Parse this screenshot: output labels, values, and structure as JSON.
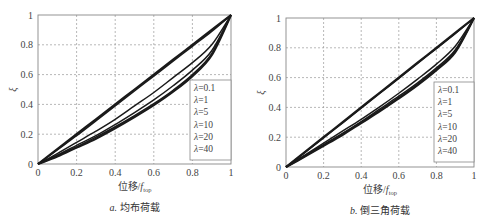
{
  "chart_data": [
    {
      "type": "line",
      "panel": "a",
      "caption": "a. 均布荷载",
      "caption_prefix": "a.",
      "caption_text": "均布荷载",
      "xlabel": "位移/f_top",
      "xlabel_main": "位移/",
      "xlabel_var": "f",
      "xlabel_sub": "top",
      "ylabel": "ξ",
      "xlim": [
        0,
        1
      ],
      "ylim": [
        0,
        1
      ],
      "xticks": [
        "0",
        "0.2",
        "0.4",
        "0.6",
        "0.8",
        "1"
      ],
      "yticks": [
        "0",
        "0.2",
        "0.4",
        "0.6",
        "0.8",
        "1"
      ],
      "grid": true,
      "legend_position": "right-inner",
      "legend": [
        "λ=0.1",
        "λ=1",
        "λ=5",
        "λ=10",
        "λ=20",
        "λ=40"
      ],
      "x": [
        0,
        0.1,
        0.2,
        0.3,
        0.4,
        0.5,
        0.6,
        0.7,
        0.8,
        0.9,
        1.0
      ],
      "series": [
        {
          "name": "λ=0.1",
          "values": [
            0,
            0.1,
            0.2,
            0.3,
            0.4,
            0.5,
            0.6,
            0.7,
            0.8,
            0.9,
            1.0
          ]
        },
        {
          "name": "λ=1",
          "values": [
            0,
            0.095,
            0.19,
            0.29,
            0.39,
            0.49,
            0.59,
            0.69,
            0.79,
            0.89,
            1.0
          ]
        },
        {
          "name": "λ=5",
          "values": [
            0,
            0.07,
            0.145,
            0.22,
            0.3,
            0.39,
            0.48,
            0.58,
            0.68,
            0.8,
            1.0
          ]
        },
        {
          "name": "λ=10",
          "values": [
            0,
            0.06,
            0.125,
            0.19,
            0.265,
            0.345,
            0.43,
            0.525,
            0.63,
            0.76,
            1.0
          ]
        },
        {
          "name": "λ=20",
          "values": [
            0,
            0.055,
            0.115,
            0.18,
            0.25,
            0.325,
            0.405,
            0.495,
            0.6,
            0.74,
            1.0
          ]
        },
        {
          "name": "λ=40",
          "values": [
            0,
            0.05,
            0.11,
            0.17,
            0.24,
            0.315,
            0.395,
            0.485,
            0.59,
            0.73,
            1.0
          ]
        }
      ]
    },
    {
      "type": "line",
      "panel": "b",
      "caption": "b. 倒三角荷载",
      "caption_prefix": "b.",
      "caption_text": "倒三角荷载",
      "xlabel": "位移/f_top",
      "xlabel_main": "位移/",
      "xlabel_var": "f",
      "xlabel_sub": "top",
      "ylabel": "ξ",
      "xlim": [
        0,
        1
      ],
      "ylim": [
        0,
        1
      ],
      "xticks": [
        "0",
        "0.2",
        "0.4",
        "0.6",
        "0.8",
        "1"
      ],
      "yticks": [
        "0",
        "0.2",
        "0.4",
        "0.6",
        "0.8",
        "1"
      ],
      "grid": true,
      "legend_position": "right-inner",
      "legend": [
        "λ=0.1",
        "λ=1",
        "λ=5",
        "λ=10",
        "λ=20",
        "λ=40"
      ],
      "x": [
        0,
        0.1,
        0.2,
        0.3,
        0.4,
        0.5,
        0.6,
        0.7,
        0.8,
        0.9,
        1.0
      ],
      "series": [
        {
          "name": "λ=0.1",
          "values": [
            0,
            0.1,
            0.2,
            0.3,
            0.4,
            0.5,
            0.6,
            0.7,
            0.8,
            0.9,
            1.0
          ]
        },
        {
          "name": "λ=1",
          "values": [
            0,
            0.097,
            0.195,
            0.295,
            0.395,
            0.495,
            0.595,
            0.695,
            0.795,
            0.895,
            1.0
          ]
        },
        {
          "name": "λ=5",
          "values": [
            0,
            0.08,
            0.16,
            0.24,
            0.32,
            0.405,
            0.495,
            0.59,
            0.69,
            0.81,
            1.0
          ]
        },
        {
          "name": "λ=10",
          "values": [
            0,
            0.075,
            0.15,
            0.225,
            0.305,
            0.39,
            0.475,
            0.565,
            0.665,
            0.785,
            1.0
          ]
        },
        {
          "name": "λ=20",
          "values": [
            0,
            0.072,
            0.145,
            0.22,
            0.3,
            0.38,
            0.465,
            0.555,
            0.655,
            0.775,
            1.0
          ]
        },
        {
          "name": "λ=40",
          "values": [
            0,
            0.07,
            0.142,
            0.215,
            0.295,
            0.375,
            0.46,
            0.55,
            0.65,
            0.77,
            1.0
          ]
        }
      ]
    }
  ],
  "panels": [
    {
      "plot": {
        "left": 38,
        "top": 15,
        "width": 193,
        "height": 149
      },
      "legend_box": {
        "left": 190,
        "top": 80,
        "width": 41,
        "height": 80
      }
    },
    {
      "plot": {
        "left": 286,
        "top": 18,
        "width": 188,
        "height": 149
      },
      "legend_box": {
        "left": 434,
        "top": 82,
        "width": 40,
        "height": 80
      }
    }
  ],
  "colors": {
    "curve": "#1a1a1a",
    "grid": "#9a9a9a",
    "axis": "#888888",
    "text": "#444444"
  }
}
